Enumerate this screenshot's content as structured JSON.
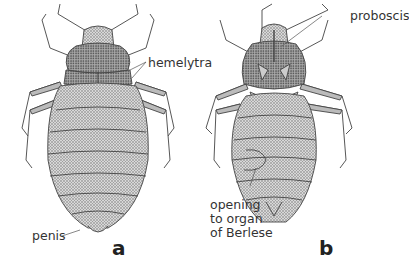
{
  "figure": {
    "panels": [
      {
        "id": "a",
        "letter": "a",
        "view": "dorsal",
        "labels": [
          {
            "text": "hemelytra"
          },
          {
            "text": "penis"
          }
        ]
      },
      {
        "id": "b",
        "letter": "b",
        "view": "ventral",
        "labels": [
          {
            "text": "proboscis"
          },
          {
            "lines": [
              "opening",
              "to organ",
              "of Berlese"
            ]
          }
        ]
      }
    ],
    "colors": {
      "ink": "#333333",
      "shading": "#8a8a8a",
      "background": "#ffffff"
    }
  }
}
